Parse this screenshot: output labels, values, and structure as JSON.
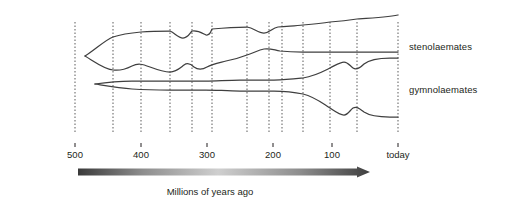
{
  "figure": {
    "name": "bryozoan-diversity-spindle-diagram",
    "background_color": "#ffffff",
    "line_color": "#3f3f3f",
    "dash_color": "#6b6b6b",
    "text_color": "#231f20"
  },
  "group_labels": [
    {
      "id": "stenolaemates",
      "text": "stenolaemates",
      "x": 409,
      "y": 41
    },
    {
      "id": "gymnolaemates",
      "text": "gymnolaemates",
      "x": 409,
      "y": 84
    }
  ],
  "axis": {
    "caption": "Millions of years ago",
    "caption_x": 210,
    "caption_y": 186,
    "tick_y": 143,
    "label_y": 149,
    "arrow": {
      "x_start": 78,
      "x_end": 370,
      "y": 172,
      "thickness": 7,
      "gradient_stops": [
        "#3a3a3a",
        "#8d8d8d",
        "#cfcfcf",
        "#8d8d8d",
        "#3f3f3f"
      ]
    },
    "ticks": [
      {
        "label": "500",
        "value": 500,
        "x": 75
      },
      {
        "label": "400",
        "value": 400,
        "x": 141
      },
      {
        "label": "300",
        "value": 300,
        "x": 207
      },
      {
        "label": "200",
        "value": 200,
        "x": 273
      },
      {
        "label": "100",
        "value": 100,
        "x": 332
      },
      {
        "label": "today",
        "value": 0,
        "x": 398
      }
    ]
  },
  "period_boundaries": {
    "description": "vertical dashed geologic period boundary lines",
    "y_top": 22,
    "y_bottom": 133,
    "x_positions": [
      75,
      113,
      141,
      170,
      192,
      212,
      247,
      269,
      282,
      303,
      330,
      357,
      398
    ]
  },
  "chart_data": {
    "type": "area",
    "title": "",
    "xlabel": "Millions of years ago",
    "ylabel": "",
    "xlim": [
      510,
      0
    ],
    "grid": false,
    "legend": "inline-right",
    "series": [
      {
        "name": "stenolaemates",
        "origin_mya": 490,
        "upper_boundary_path": "M 85 56 C 95 50 105 40 113 37 C 122 34 130 33 141 32 C 152 31 162 31 170 31 C 175 33 178 38 183 38 C 188 38 190 33 192 31 C 198 30 202 33 206 35 C 210 36 211 31 212 29 C 222 28 236 27 247 27 C 254 28 258 33 264 33 C 270 33 272 28 278 27 C 290 26 296 26 303 25 C 315 24 324 23 330 22 C 342 21 350 20 357 19 C 372 18 388 17 398 15",
        "lower_boundary_path": "M 85 56 C 95 62 104 69 113 70 C 120 71 126 69 132 66 C 138 63 142 64 150 67 C 158 70 164 72 170 72 C 176 72 180 68 184 65 C 188 62 191 64 194 67 C 198 70 202 70 207 67 C 212 64 218 63 226 61 C 236 59 242 57 247 55 C 254 53 258 50 264 49 C 270 48 274 50 280 51 C 290 52 296 52 303 52 C 316 52 324 52 330 52 C 342 52 350 52 357 52 C 372 52 388 52 398 52"
      },
      {
        "name": "gymnolaemates",
        "origin_mya": 480,
        "upper_boundary_path": "M 95 84 C 108 82 120 81 132 81 C 148 81 160 81 170 81 C 185 81 196 81 206 81 C 216 81 228 80 240 80 C 252 80 262 80 274 80 C 286 80 294 79 303 78 C 315 76 322 72 330 68 C 336 65 340 62 344 62 C 348 62 350 66 353 68 C 356 70 360 68 364 64 C 370 59 380 58 390 58 C 394 58 396 58 398 58",
        "lower_boundary_path": "M 95 84 C 108 86 120 88 132 89 C 148 90 160 90 170 90 C 185 90 196 90 206 90 C 216 90 228 91 240 91 C 252 91 262 91 274 91 C 286 91 294 92 303 94 C 315 97 322 103 330 108 C 336 112 340 115 344 115 C 348 115 350 110 353 108 C 357 106 360 109 364 112 C 370 116 380 117 390 117 C 394 117 396 117 398 117"
      }
    ],
    "annotations": [
      {
        "text": "stenolaemates",
        "attach_x": 398,
        "attach_y": 44
      },
      {
        "text": "gymnolaemates",
        "attach_x": 398,
        "attach_y": 88
      }
    ]
  }
}
